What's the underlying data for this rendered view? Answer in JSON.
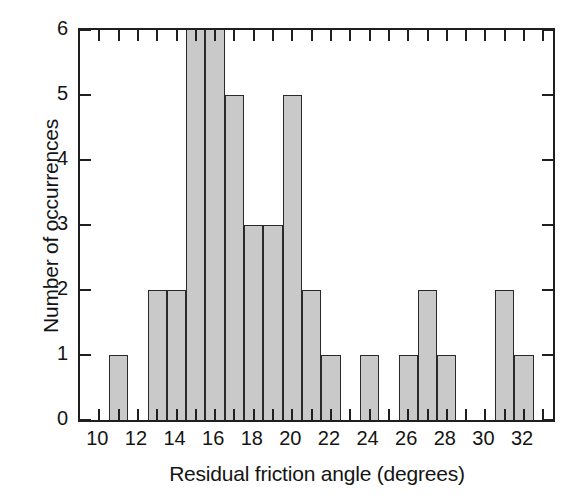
{
  "chart_data": {
    "type": "bar",
    "title": "",
    "subtitle": "",
    "xlabel": "Residual friction angle (degrees)",
    "ylabel": "Number of occurrences",
    "xlim": [
      9,
      33.5
    ],
    "ylim": [
      0,
      6
    ],
    "grid": false,
    "legend": null,
    "bar_color": "#c9c9c9",
    "bar_edge_color": "#2a2a2a",
    "axis_color": "#1f1f1f",
    "background": "#ffffff",
    "bin_width": 1,
    "xticks": [
      10,
      12,
      14,
      16,
      18,
      20,
      22,
      24,
      26,
      28,
      30,
      32
    ],
    "xtick_labels": [
      "10",
      "12",
      "14",
      "16",
      "18",
      "20",
      "22",
      "24",
      "26",
      "28",
      "30",
      "32"
    ],
    "xticks_minor": [
      11,
      13,
      15,
      17,
      19,
      21,
      23,
      25,
      27,
      29,
      31,
      33
    ],
    "yticks": [
      0,
      1,
      2,
      3,
      4,
      5,
      6
    ],
    "ytick_labels": [
      "0",
      "1",
      "2",
      "3",
      "4",
      "5",
      "6"
    ],
    "categories": [
      10,
      11,
      12,
      13,
      14,
      15,
      16,
      17,
      18,
      19,
      20,
      21,
      22,
      23,
      24,
      25,
      26,
      27,
      28,
      29,
      30,
      31,
      32
    ],
    "values": [
      0,
      1,
      0,
      2,
      2,
      6,
      6,
      5,
      3,
      3,
      5,
      2,
      1,
      0,
      1,
      0,
      1,
      2,
      1,
      0,
      0,
      2,
      1
    ],
    "bars": [
      {
        "x": 11,
        "value": 1
      },
      {
        "x": 13,
        "value": 2
      },
      {
        "x": 14,
        "value": 2
      },
      {
        "x": 15,
        "value": 6
      },
      {
        "x": 16,
        "value": 6
      },
      {
        "x": 17,
        "value": 5
      },
      {
        "x": 18,
        "value": 3
      },
      {
        "x": 19,
        "value": 3
      },
      {
        "x": 20,
        "value": 5
      },
      {
        "x": 21,
        "value": 2
      },
      {
        "x": 22,
        "value": 1
      },
      {
        "x": 24,
        "value": 1
      },
      {
        "x": 26,
        "value": 1
      },
      {
        "x": 27,
        "value": 2
      },
      {
        "x": 28,
        "value": 1
      },
      {
        "x": 31,
        "value": 2
      },
      {
        "x": 32,
        "value": 1
      }
    ]
  }
}
